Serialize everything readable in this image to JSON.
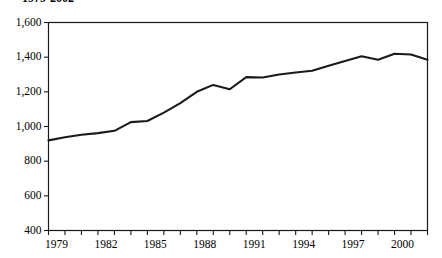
{
  "chart_data": {
    "type": "line",
    "title": "1979-2002",
    "xlabel": "",
    "ylabel": "",
    "grid": false,
    "legend": null,
    "line_color": "#1a1a1a",
    "x": [
      1979,
      1980,
      1981,
      1982,
      1983,
      1984,
      1985,
      1986,
      1987,
      1988,
      1989,
      1990,
      1991,
      1992,
      1993,
      1994,
      1995,
      1996,
      1997,
      1998,
      1999,
      2000,
      2001,
      2002
    ],
    "values": [
      920,
      938,
      952,
      962,
      975,
      1025,
      1032,
      1080,
      1135,
      1200,
      1240,
      1215,
      1285,
      1283,
      1300,
      1312,
      1322,
      1350,
      1378,
      1405,
      1385,
      1420,
      1415,
      1385
    ],
    "xlim": [
      1979,
      2002
    ],
    "ylim": [
      400,
      1600
    ],
    "ytick_values": [
      1600,
      1400,
      1200,
      1000,
      800,
      600,
      400
    ],
    "ytick_labels": [
      "1,600",
      "1,400",
      "1,200",
      "1,000",
      "800",
      "600",
      "400"
    ],
    "xtick_values": [
      1979,
      1982,
      1985,
      1988,
      1991,
      1994,
      1997,
      2000
    ],
    "xtick_labels": [
      "1979",
      "1982",
      "1985",
      "1988",
      "1991",
      "1994",
      "1997",
      "2000"
    ],
    "xtick_minor_all": [
      1979,
      1980,
      1981,
      1982,
      1983,
      1984,
      1985,
      1986,
      1987,
      1988,
      1989,
      1990,
      1991,
      1992,
      1993,
      1994,
      1995,
      1996,
      1997,
      1998,
      1999,
      2000,
      2001,
      2002
    ]
  }
}
